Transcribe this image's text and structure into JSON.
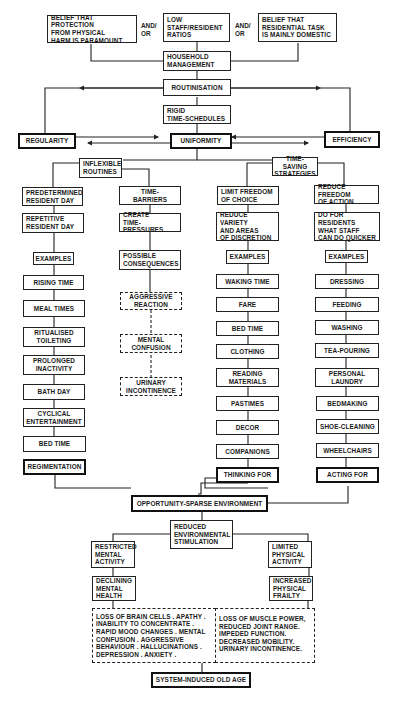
{
  "diagram": {
    "top": {
      "cause_1": "BELIEF THAT PROTECTION\nFROM PHYSICAL\nHARM IS PARAMOUNT",
      "andor_1": "AND/\nOR",
      "cause_2": "LOW\nSTAFF/RESIDENT\nRATIOS",
      "andor_2": "AND/\nOR",
      "cause_3": "BELIEF THAT\nRESIDENTIAL TASK\nIS MAINLY DOMESTIC",
      "household": "HOUSEHOLD\nMANAGEMENT",
      "routinisation": "ROUTINISATION",
      "rigid": "RIGID\nTIME-SCHEDULES",
      "regularity": "REGULARITY",
      "uniformity": "UNIFORMITY",
      "efficiency": "EFFICIENCY"
    },
    "inflexible": {
      "title": "INFLEXIBLE\nROUTINES",
      "predetermined": {
        "title": "PREDETERMINED\nRESIDENT DAY",
        "repetitive": "REPETITIVE\nRESIDENT DAY",
        "examples": "EXAMPLES",
        "items": [
          "RISING TIME",
          "MEAL TIMES",
          "RITUALISED\nTOILETING",
          "PROLONGED\nINACTIVITY",
          "BATH DAY",
          "CYCLICAL\nENTERTAINMENT",
          "BED TIME"
        ],
        "outcome": "REGIMENTATION"
      },
      "barriers": {
        "title": "TIME-\nBARRIERS",
        "create": "CREATE\nTIME-PRESSURES",
        "possible": "POSSIBLE\nCONSEQUENCES",
        "consequences": [
          "AGGRESSIVE\nREACTION",
          "MENTAL\nCONFUSION",
          "URINARY\nINCONTINENCE"
        ]
      }
    },
    "timesaving": {
      "title": "TIME-SAVING\nSTRATEGIES",
      "choice": {
        "title": "LIMIT FREEDOM\nOF CHOICE",
        "reduce": "REDUCE VARIETY\nAND AREAS\nOF DISCRETION",
        "examples": "EXAMPLES",
        "items": [
          "WAKING TIME",
          "FARE",
          "BED TIME",
          "CLOTHING",
          "READING\nMATERIALS",
          "PASTIMES",
          "DECOR",
          "COMPANIONS"
        ],
        "outcome": "THINKING FOR"
      },
      "action": {
        "title": "REDUCE FREEDOM\nOF ACTION",
        "do_for": "DO FOR RESIDENTS\nWHAT STAFF\nCAN DO QUICKER",
        "examples": "EXAMPLES",
        "items": [
          "DRESSING",
          "FEEDING",
          "WASHING",
          "TEA-POURING",
          "PERSONAL\nLAUNDRY",
          "BEDMAKING",
          "SHOE-CLEANING",
          "WHEELCHAIRS"
        ],
        "outcome": "ACTING FOR"
      }
    },
    "bottom": {
      "opportunity": "OPPORTUNITY-SPARSE ENVIRONMENT",
      "reduced": "REDUCED\nENVIRONMENTAL\nSTIMULATION",
      "restricted": "RESTRICTED\nMENTAL\nACTIVITY",
      "limited": "LIMITED\nPHYSICAL\nACTIVITY",
      "declining": "DECLINING\nMENTAL\nHEALTH",
      "increased": "INCREASED\nPHYSICAL\nFRAILTY",
      "mental_effects": "LOSS OF BRAIN CELLS . APATHY .\nINABILITY TO CONCENTRATE .\nRAPID MOOD CHANGES . MENTAL\nCONFUSION . AGGRESSIVE\nBEHAVIOUR . HALLUCINATIONS .\nDEPRESSION . ANXIETY .",
      "physical_effects": "LOSS OF MUSCLE POWER,\nREDUCED JOINT RANGE.\nIMPEDED FUNCTION.\nDECREASED MOBILITY.\nURINARY INCONTINENCE.",
      "final": "SYSTEM-INDUCED OLD AGE"
    }
  }
}
